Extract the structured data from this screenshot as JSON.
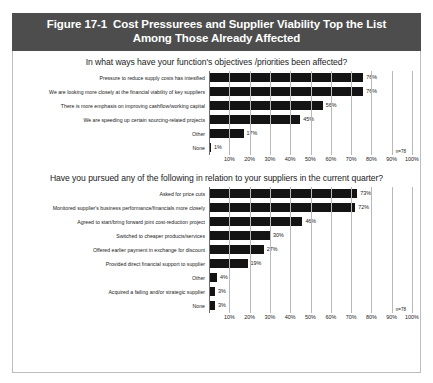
{
  "figure": {
    "number": "Figure 17-1",
    "title_line1": "Cost Pressurees and Supplier Viability Top the List",
    "title_line2": "Among Those Already Affected",
    "header_bg": "#4d4d4d",
    "bar_color": "#141414"
  },
  "chart_data": [
    {
      "type": "bar",
      "orientation": "horizontal",
      "title": "In what ways have your function's objectives /priorities been affected?",
      "categories": [
        "Pressure to reduce supply costs has intesified",
        "We are looking more closely at the financial viability of key suppliers",
        "There is more emphasis on improving cashflow/working capital",
        "We are speeding up certain sourcing-related projects",
        "Other",
        "None"
      ],
      "values": [
        76,
        76,
        56,
        45,
        17,
        1
      ],
      "value_labels": [
        "76%",
        "76%",
        "56%",
        "45%",
        "17%",
        "1%"
      ],
      "xlabel": "",
      "ylabel": "",
      "xlim": [
        0,
        100
      ],
      "xticks": [
        10,
        20,
        30,
        40,
        50,
        60,
        70,
        80,
        90,
        100
      ],
      "xtick_labels": [
        "10%",
        "20%",
        "30%",
        "40%",
        "50%",
        "60%",
        "70%",
        "80%",
        "90%",
        "100%"
      ],
      "grid": true,
      "legend": "none",
      "annotation": "n=78"
    },
    {
      "type": "bar",
      "orientation": "horizontal",
      "title": "Have you pursued any of the following in relation to your suppliers in the current quarter?",
      "categories": [
        "Asked for price cuts",
        "Monitored supplier's business performance/financials more closely",
        "Agreed to start/bring forward joint cost-reduction project",
        "Switched to cheaper products/services",
        "Offered earlier payment in exchange for discount",
        "Provided direct financial support to supplier",
        "Other",
        "Acquired a failing and/or strategic supplier",
        "None"
      ],
      "values": [
        73,
        72,
        46,
        30,
        27,
        19,
        4,
        3,
        3
      ],
      "value_labels": [
        "73%",
        "72%",
        "46%",
        "30%",
        "27%",
        "19%",
        "4%",
        "3%",
        "3%"
      ],
      "xlabel": "",
      "ylabel": "",
      "xlim": [
        0,
        100
      ],
      "xticks": [
        10,
        20,
        30,
        40,
        50,
        60,
        70,
        80,
        90,
        100
      ],
      "xtick_labels": [
        "10%",
        "20%",
        "30%",
        "40%",
        "50%",
        "60%",
        "70%",
        "80%",
        "90%",
        "100%"
      ],
      "grid": true,
      "legend": "none",
      "annotation": "n=78"
    }
  ]
}
